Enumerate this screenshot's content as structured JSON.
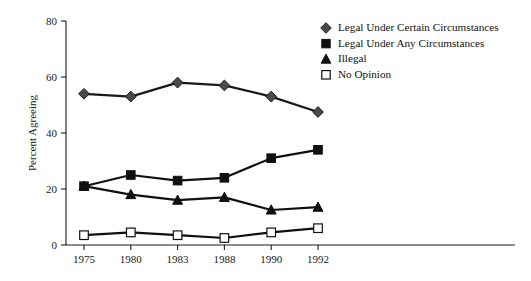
{
  "chart_data": {
    "type": "line",
    "title": "",
    "xlabel": "",
    "ylabel": "Percent Agreeing",
    "categories": [
      "1975",
      "1980",
      "1983",
      "1988",
      "1990",
      "1992"
    ],
    "ylim": [
      0,
      80
    ],
    "yticks": [
      0,
      20,
      40,
      60,
      80
    ],
    "grid": false,
    "legend_position": "top-right",
    "series": [
      {
        "name": "Legal Under Certain Circumstances",
        "marker": "diamond",
        "color": "#4a4a4a",
        "line_color": "#1a1a1a",
        "filled": true,
        "values": [
          54,
          53,
          58,
          57,
          53,
          47.5
        ]
      },
      {
        "name": "Legal Under Any Circumstances",
        "marker": "square",
        "color": "#111111",
        "line_color": "#111111",
        "filled": true,
        "values": [
          21,
          25,
          23,
          24,
          31,
          34
        ]
      },
      {
        "name": "Illegal",
        "marker": "triangle",
        "color": "#111111",
        "line_color": "#111111",
        "filled": true,
        "values": [
          21,
          18,
          16,
          17,
          12.5,
          13.5
        ]
      },
      {
        "name": "No Opinion",
        "marker": "square-open",
        "color": "#ffffff",
        "line_color": "#111111",
        "filled": false,
        "values": [
          3.5,
          4.5,
          3.5,
          2.5,
          4.5,
          6
        ]
      }
    ]
  },
  "legend": {
    "entries": [
      {
        "label": "Legal Under Certain Circumstances",
        "marker": "diamond"
      },
      {
        "label": "Legal Under Any Circumstances",
        "marker": "square"
      },
      {
        "label": "Illegal",
        "marker": "triangle"
      },
      {
        "label": "No Opinion",
        "marker": "square-open"
      }
    ]
  }
}
